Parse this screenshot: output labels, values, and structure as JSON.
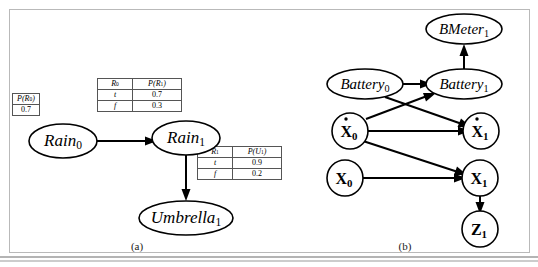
{
  "figure": {
    "panels": [
      {
        "id": "a",
        "caption": "(a)"
      },
      {
        "id": "b",
        "caption": "(b)"
      }
    ]
  },
  "panel_a": {
    "nodes": [
      {
        "name": "rain0",
        "label": "Rain",
        "subscript": "0"
      },
      {
        "name": "rain1",
        "label": "Rain",
        "subscript": "1"
      },
      {
        "name": "umbrella1",
        "label": "Umbrella",
        "subscript": "1"
      }
    ],
    "edges": [
      {
        "from": "Rain0",
        "to": "Rain1"
      },
      {
        "from": "Rain1",
        "to": "Umbrella1"
      }
    ],
    "tables": [
      {
        "name": "prior-table-rain0",
        "headers": [
          "P(R",
          "0",
          ")"
        ],
        "header_text": "P(R0)",
        "rows": [
          {
            "value": "0.7"
          }
        ]
      },
      {
        "name": "cpt-table-rain1",
        "col1_header": "R0",
        "col2_header": "P(R1)",
        "rows": [
          {
            "cond": "t",
            "prob": "0.7"
          },
          {
            "cond": "f",
            "prob": "0.3"
          }
        ]
      },
      {
        "name": "cpt-table-umbrella1",
        "col1_header": "R1",
        "col2_header": "P(U1)",
        "rows": [
          {
            "cond": "t",
            "prob": "0.9"
          },
          {
            "cond": "f",
            "prob": "0.2"
          }
        ]
      }
    ]
  },
  "panel_b": {
    "nodes": [
      {
        "name": "bmeter1",
        "label": "BMeter",
        "subscript": "1",
        "style": "italic"
      },
      {
        "name": "battery0",
        "label": "Battery",
        "subscript": "0",
        "style": "italic"
      },
      {
        "name": "battery1",
        "label": "Battery",
        "subscript": "1",
        "style": "italic"
      },
      {
        "name": "xdot0",
        "label": "X",
        "subscript": "0",
        "style": "bold-dot"
      },
      {
        "name": "xdot1",
        "label": "X",
        "subscript": "1",
        "style": "bold-dot"
      },
      {
        "name": "x0",
        "label": "X",
        "subscript": "0",
        "style": "bold"
      },
      {
        "name": "x1",
        "label": "X",
        "subscript": "1",
        "style": "bold"
      },
      {
        "name": "z1",
        "label": "Z",
        "subscript": "1",
        "style": "bold"
      }
    ],
    "edges": [
      {
        "from": "Battery0",
        "to": "Battery1"
      },
      {
        "from": "Battery1",
        "to": "BMeter1"
      },
      {
        "from": "Battery0",
        "to": "Xdot1"
      },
      {
        "from": "Xdot0",
        "to": "Battery1"
      },
      {
        "from": "Xdot0",
        "to": "Xdot1"
      },
      {
        "from": "Xdot0",
        "to": "X1"
      },
      {
        "from": "X0",
        "to": "X1"
      },
      {
        "from": "X1",
        "to": "Z1"
      }
    ]
  },
  "colors": {
    "frame": "#b9b9b9",
    "stroke": "#000000",
    "table_border": "#555555",
    "background": "#ffffff"
  }
}
